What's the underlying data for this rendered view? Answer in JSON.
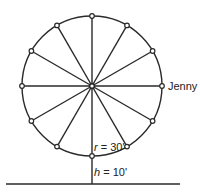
{
  "diagram": {
    "type": "ferris-wheel",
    "center": {
      "x": 92,
      "y": 86
    },
    "radius_px": 70,
    "spokes": 12,
    "ground_y": 184,
    "ground_x1": 6,
    "ground_x2": 180,
    "stroke_color": "#2a2a2a",
    "rider_label": "Jenny",
    "radius_label_var": "r",
    "radius_label_value": " = 30'",
    "height_label_var": "h",
    "height_label_value": " = 10'"
  }
}
